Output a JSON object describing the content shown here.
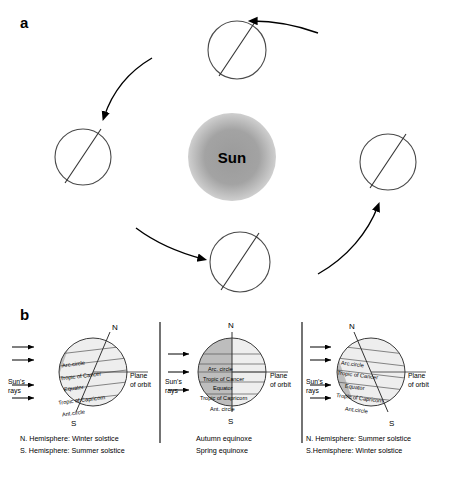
{
  "panels": {
    "a_label": "a",
    "b_label": "b"
  },
  "panel_a": {
    "sun_label": "Sun",
    "sun_color": "#9e9e9e",
    "earth_outline_color": "#4a4a4a",
    "orbit_arrow_color": "#000000",
    "positions": [
      {
        "name": "top-earth"
      },
      {
        "name": "left-earth"
      },
      {
        "name": "right-earth"
      },
      {
        "name": "bottom-earth"
      }
    ]
  },
  "panel_b": {
    "sub_panels": [
      {
        "id": "left",
        "pole_top": "N",
        "pole_bottom": "S",
        "sun_rays_label": "Sun's\nrays",
        "sun_rays_line1": "Sun's",
        "sun_rays_line2": "rays",
        "plane_label_line1": "Plane",
        "plane_label_line2": "of orbit",
        "circles": [
          "Arc.circle",
          "Tropic of Cancer",
          "Equator",
          "Tropic of Capricorn",
          "Ant.circle"
        ],
        "caption_line1": "N. Hemisphere: Winter solstice",
        "caption_line2": "S. Hemisphere: Summer solstice",
        "lit_side": "right"
      },
      {
        "id": "middle",
        "pole_top": "N",
        "pole_bottom": "S",
        "sun_rays_line1": "Sun's",
        "sun_rays_line2": "rays",
        "plane_label_line1": "Plane",
        "plane_label_line2": "of orbit",
        "circles": [
          "Arc. circle",
          "Tropic of Cancer",
          "Equator",
          "Tropic of Capricorn",
          "Ant. circle"
        ],
        "caption_line1": "Autumn equinoxe",
        "caption_line2": "Spring equinoxe",
        "lit_side": "right"
      },
      {
        "id": "right",
        "pole_top": "N",
        "pole_bottom": "S",
        "sun_rays_line1": "Sun's",
        "sun_rays_line2": "rays",
        "plane_label_line1": "Plane",
        "plane_label_line2": "of orbit",
        "circles": [
          "Arc.circle",
          "Tropic of Cancer",
          "Equator",
          "Tropic of Capricorn",
          "Ant.circle"
        ],
        "caption_line1": "N. Hemisphere: Summer solstice",
        "caption_line2": "S.Hemisphere: Winter solstice",
        "lit_side": "left"
      }
    ],
    "shade_dark": "#bdbdbd",
    "shade_light": "#eeeeee",
    "ray_arrow_color": "#000000",
    "divider_color": "#000000"
  }
}
